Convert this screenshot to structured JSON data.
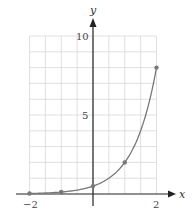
{
  "chart_data": {
    "type": "line",
    "title": "",
    "xlabel": "x",
    "ylabel": "y",
    "xlim": [
      -2,
      2
    ],
    "ylim": [
      0,
      10
    ],
    "grid": true,
    "x_grid_step": 0.5,
    "y_grid_step": 1,
    "x_ticks": [
      {
        "value": -2,
        "label": "−2"
      },
      {
        "value": 0,
        "label": ""
      },
      {
        "value": 2,
        "label": "2"
      }
    ],
    "y_ticks": [
      {
        "value": 5,
        "label": "5"
      },
      {
        "value": 10,
        "label": "10"
      }
    ],
    "series": [
      {
        "name": "y = 0.5·4^x",
        "function": "0.5*4^x",
        "color": "#777777",
        "x": [
          -2,
          -1,
          0,
          1,
          2
        ],
        "values": [
          0.03125,
          0.125,
          0.5,
          2,
          8
        ]
      }
    ],
    "points": [
      {
        "x": -2,
        "y": 0.03125
      },
      {
        "x": -1,
        "y": 0.125
      },
      {
        "x": 0,
        "y": 0.5
      },
      {
        "x": 1,
        "y": 2
      },
      {
        "x": 2,
        "y": 8
      }
    ]
  },
  "colors": {
    "grid": "#d8d8d8",
    "axis": "#222222",
    "curve": "#777777",
    "point": "#777777"
  }
}
